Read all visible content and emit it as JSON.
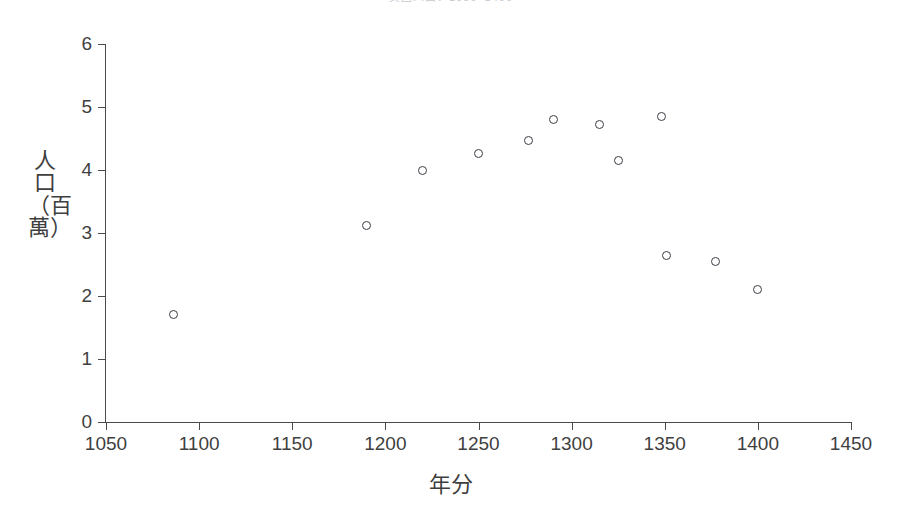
{
  "chart_data": {
    "type": "scatter",
    "title": "英國人口：1086–1400",
    "xlabel": "年分",
    "ylabel": "人口（百萬）",
    "xlim": [
      1050,
      1450
    ],
    "ylim": [
      0,
      6
    ],
    "grid": false,
    "legend": null,
    "xticks": [
      "1050",
      "1100",
      "1150",
      "1200",
      "1250",
      "1300",
      "1350",
      "1400",
      "1450"
    ],
    "xtick_values": [
      1050,
      1100,
      1150,
      1200,
      1250,
      1300,
      1350,
      1400,
      1450
    ],
    "yticks": [
      "0",
      "1",
      "2",
      "3",
      "4",
      "5",
      "6"
    ],
    "ytick_values": [
      0,
      1,
      2,
      3,
      4,
      5,
      6
    ],
    "marker": "open-circle",
    "marker_color": "#3c3c46",
    "points": [
      {
        "x": 1086,
        "y": 1.71
      },
      {
        "x": 1190,
        "y": 3.12
      },
      {
        "x": 1220,
        "y": 4.0
      },
      {
        "x": 1250,
        "y": 4.26
      },
      {
        "x": 1277,
        "y": 4.47
      },
      {
        "x": 1290,
        "y": 4.8
      },
      {
        "x": 1315,
        "y": 4.73
      },
      {
        "x": 1325,
        "y": 4.15
      },
      {
        "x": 1348,
        "y": 4.85
      },
      {
        "x": 1351,
        "y": 2.65
      },
      {
        "x": 1377,
        "y": 2.54
      },
      {
        "x": 1400,
        "y": 2.11
      }
    ]
  },
  "axes": {
    "y_title": "人口（百萬）",
    "x_title": "年分"
  }
}
